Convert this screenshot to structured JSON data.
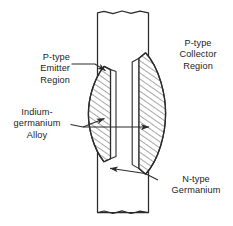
{
  "figure": {
    "type": "diagram",
    "background_color": "#ffffff",
    "line_color": "#2b2b2b",
    "hatch_color": "#555555",
    "text_color": "#1d1d1d"
  },
  "labels": {
    "emitter": {
      "text": "P-type\nEmitter\nRegion",
      "align": "right",
      "lines": [
        "P-type",
        "Emitter",
        "Region"
      ]
    },
    "indium": {
      "text": "Indium-\ngermanium\nAlloy",
      "align": "center",
      "lines": [
        "Indium-",
        "germanium",
        "Alloy"
      ]
    },
    "collector": {
      "text": "P-type\nCollector\nRegion",
      "align": "center",
      "lines": [
        "P-type",
        "Collector",
        "Region"
      ]
    },
    "ntype": {
      "text": "N-type\nGermanium",
      "align": "center",
      "lines": [
        "N-type",
        "Germanium"
      ]
    }
  },
  "parts": {
    "bar_name": "N-type germanium bar",
    "emitter_lens_name": "emitter alloy lens",
    "collector_lens_name": "collector alloy lens"
  }
}
